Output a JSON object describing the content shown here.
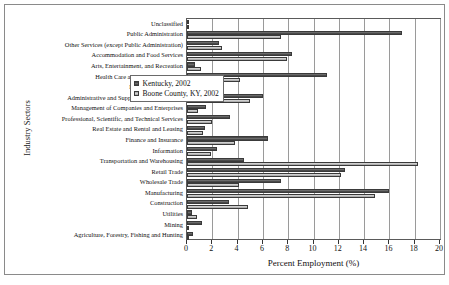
{
  "chart_data": {
    "type": "bar",
    "orientation": "horizontal",
    "title": "",
    "xlabel": "Percent Employment (%)",
    "ylabel": "Industry Sectors",
    "xlim": [
      0,
      20
    ],
    "xticks": [
      0,
      2,
      4,
      6,
      8,
      10,
      12,
      14,
      16,
      18,
      20
    ],
    "grid": true,
    "grid_axis": "x",
    "legend_position": "center-right",
    "categories": [
      "Unclassified",
      "Public Administration",
      "Other Services (except Public Administration)",
      "Accommodation and Food Services",
      "Arts, Entertainment, and Recreation",
      "Health Care and Social Assistance",
      "Educational Services",
      "Administrative and Support and Waste Mgm.",
      "Management of Companies and Enterprises",
      "Professional, Scientific, and Technical Services",
      "Real Estate and Rental and Leasing",
      "Finance and Insurance",
      "Information",
      "Transportation and Warehousing",
      "Retail Trade",
      "Wholesale Trade",
      "Manufacturing",
      "Construction",
      "Utilities",
      "Mining",
      "Agriculture, Forestry, Fishing and Hunting"
    ],
    "series": [
      {
        "name": "Kentucky, 2002",
        "color": "#555555",
        "values": [
          0.1,
          17.0,
          2.5,
          8.3,
          0.6,
          11.1,
          0.8,
          6.0,
          1.5,
          3.4,
          1.4,
          6.4,
          2.4,
          4.5,
          12.5,
          7.4,
          16.0,
          3.3,
          0.4,
          1.2,
          0.5
        ]
      },
      {
        "name": "Boone County, KY, 2002",
        "color": "#bdbdbd",
        "values": [
          0.05,
          7.4,
          2.8,
          7.9,
          1.1,
          4.2,
          0.4,
          5.0,
          0.9,
          2.0,
          1.3,
          3.8,
          1.9,
          18.3,
          12.2,
          4.1,
          14.9,
          4.8,
          0.8,
          0.05,
          0.1
        ]
      }
    ]
  },
  "legend": {
    "entries": [
      {
        "label": "Kentucky, 2002"
      },
      {
        "label": "Boone County, KY, 2002"
      }
    ]
  }
}
